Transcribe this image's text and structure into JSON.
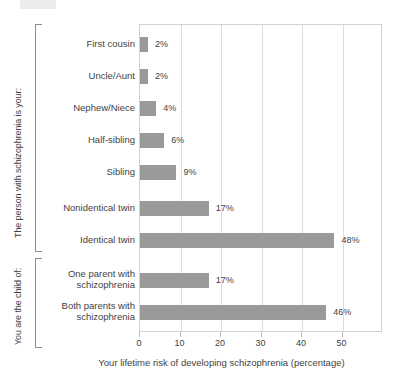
{
  "chart_data": {
    "type": "bar",
    "orientation": "horizontal",
    "title": "",
    "xlabel": "Your lifetime risk of developing schizophrenia (percentage)",
    "ylabel": "",
    "xlim": [
      0,
      60
    ],
    "xticks": [
      0,
      10,
      20,
      30,
      40,
      50
    ],
    "xtick_labels": [
      "0",
      "10",
      "20",
      "30",
      "40",
      "50"
    ],
    "grid": "vertical",
    "legend": "none",
    "bar_color": "#9a9a9a",
    "categories": [
      "First cousin",
      "Uncle/Aunt",
      "Nephew/Niece",
      "Half-sibling",
      "Sibling",
      "Nonidentical twin",
      "Identical twin",
      "One parent with schizophrenia",
      "Both parents with schizophrenia"
    ],
    "values": [
      2,
      2,
      4,
      6,
      9,
      17,
      48,
      17,
      46
    ],
    "value_labels": [
      "2%",
      "2%",
      "4%",
      "6%",
      "9%",
      "17%",
      "48%",
      "17%",
      "46%"
    ],
    "groups": [
      {
        "caption": "The person with schizophrenia is your:",
        "categories": [
          "First cousin",
          "Uncle/Aunt",
          "Nephew/Niece",
          "Half-sibling",
          "Sibling",
          "Nonidentical twin",
          "Identical twin"
        ]
      },
      {
        "caption": "You are the child of:",
        "categories": [
          "One parent with schizophrenia",
          "Both parents with schizophrenia"
        ]
      }
    ]
  },
  "rows": [
    {
      "label": "First cousin",
      "label_lines": "First cousin",
      "value": 2,
      "value_label": "2%",
      "top": 8,
      "group": 0
    },
    {
      "label": "Uncle/Aunt",
      "label_lines": "Uncle/Aunt",
      "value": 2,
      "value_label": "2%",
      "top": 40,
      "group": 0
    },
    {
      "label": "Nephew/Niece",
      "label_lines": "Nephew/Niece",
      "value": 4,
      "value_label": "4%",
      "top": 72,
      "group": 0
    },
    {
      "label": "Half-sibling",
      "label_lines": "Half-sibling",
      "value": 6,
      "value_label": "6%",
      "top": 104,
      "group": 0
    },
    {
      "label": "Sibling",
      "label_lines": "Sibling",
      "value": 9,
      "value_label": "9%",
      "top": 136,
      "group": 0
    },
    {
      "label": "Nonidentical twin",
      "label_lines": "Nonidentical twin",
      "value": 17,
      "value_label": "17%",
      "top": 172,
      "group": 0
    },
    {
      "label": "Identical twin",
      "label_lines": "Identical twin",
      "value": 48,
      "value_label": "48%",
      "top": 204,
      "group": 0
    },
    {
      "label": "One parent with schizophrenia",
      "label_lines": "One parent with\nschizophrenia",
      "value": 17,
      "value_label": "17%",
      "top": 244,
      "group": 1
    },
    {
      "label": "Both parents with schizophrenia",
      "label_lines": "Both parents with\nschizophrenia",
      "value": 46,
      "value_label": "46%",
      "top": 276,
      "group": 1
    }
  ],
  "captions": {
    "person": "The person with schizophrenia is your:",
    "child": "You are the child of:"
  },
  "axis": {
    "title": "Your lifetime risk of developing schizophrenia (percentage)",
    "ticks": [
      "0",
      "10",
      "20",
      "30",
      "40",
      "50"
    ]
  }
}
